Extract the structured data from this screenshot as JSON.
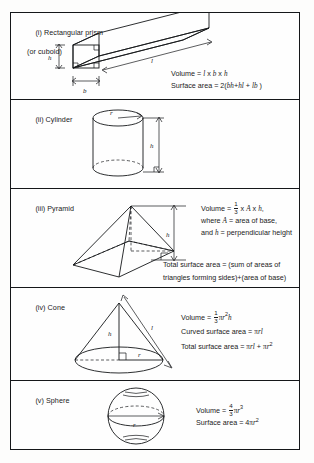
{
  "document": {
    "title": "Mensuration formulae for solids",
    "type": "formula-reference-table"
  },
  "sections": [
    {
      "id": "rectangular-prism",
      "numeral": "(i)",
      "label_line1": "(i) Rectangular prism",
      "label_line2": "(or cuboid)",
      "diagram": {
        "name": "rectangular-prism-diagram",
        "dimension_labels": [
          "h",
          "b",
          "l"
        ],
        "right_angle_marks": 3
      },
      "formulas": [
        {
          "lhs": "Volume",
          "rhs": "l x b x h"
        },
        {
          "lhs": "Surface area",
          "rhs": "2(bh + hl + lb)"
        }
      ]
    },
    {
      "id": "cylinder",
      "numeral": "(ii)",
      "label_line1": "(ii) Cylinder",
      "label_line2": "",
      "diagram": {
        "name": "cylinder-diagram",
        "dimension_labels": [
          "r",
          "h"
        ]
      },
      "formulas": [
        {
          "lhs": "Volume",
          "rhs": "πr²h"
        },
        {
          "lhs": "Total surface area",
          "rhs": "2πrh + 2πr²"
        }
      ]
    },
    {
      "id": "pyramid",
      "numeral": "(iii)",
      "label_line1": "(iii) Pyramid",
      "label_line2": "",
      "diagram": {
        "name": "pyramid-diagram",
        "dimension_labels": [
          "h"
        ]
      },
      "formula_lines": [
        "Volume = 1/3 x A x h,",
        "where A = area of base,",
        "and h = perpendicular height",
        "Total surface area = (sum of areas of",
        "triangles forming sides)+(area of base)"
      ]
    },
    {
      "id": "cone",
      "numeral": "(iv)",
      "label_line1": "(iv) Cone",
      "label_line2": "",
      "diagram": {
        "name": "cone-diagram",
        "dimension_labels": [
          "h",
          "l",
          "r"
        ]
      },
      "formulas": [
        {
          "lhs": "Volume",
          "rhs": "1/3 πr²h"
        },
        {
          "lhs": "Curved surface area",
          "rhs": "πrl"
        },
        {
          "lhs": "Total surface area",
          "rhs": "πrl + πr²"
        }
      ]
    },
    {
      "id": "sphere",
      "numeral": "(v)",
      "label_line1": "(v) Sphere",
      "label_line2": "",
      "diagram": {
        "name": "sphere-diagram",
        "dimension_labels": [
          "r"
        ]
      },
      "formulas": [
        {
          "lhs": "Volume",
          "rhs": "4/3 πr³"
        },
        {
          "lhs": "Surface area",
          "rhs": "4πr²"
        }
      ]
    }
  ],
  "text": {
    "s1_label1": "(i) Rectangular prism",
    "s1_label2": "(or cuboid)",
    "s1_vol_lhs": "Volume = ",
    "s1_vol_l": "l",
    "s1_vol_x1": " x ",
    "s1_vol_b": "b",
    "s1_vol_x2": " x ",
    "s1_vol_h": "h",
    "s1_sa_lhs": "Surface area = 2(",
    "s1_sa_bh": "bh",
    "s1_sa_p1": "+",
    "s1_sa_hl": "hl",
    "s1_sa_p2": " + ",
    "s1_sa_lb": "lb",
    "s1_sa_end": " )",
    "s1_dim_h": "h",
    "s1_dim_b": "b",
    "s1_dim_l": "l",
    "s2_label1": "(ii) Cylinder",
    "s2_vol": "Volume  =  ",
    "s2_vol_pi": "π",
    "s2_vol_r": "r",
    "s2_vol_sup": "2",
    "s2_vol_h": "h",
    "s2_tsa": "Total surface area = 2",
    "s2_tsa_pi": "π",
    "s2_tsa_r": "r",
    "s2_tsa_h": "h",
    "s2_tsa_plus": " + 2 ",
    "s2_tsa_pi2": "π",
    "s2_tsa_r2": "r",
    "s2_tsa_sup": "2",
    "s2_dim_r": "r",
    "s2_dim_h": "h",
    "s3_label1": "(iii) Pyramid",
    "s3_vol_pre": "Volume = ",
    "s3_frac_num": "1",
    "s3_frac_den": "3",
    "s3_vol_mid": " x ",
    "s3_vol_A": "A",
    "s3_vol_x": " x ",
    "s3_vol_h": "h",
    "s3_vol_end": ",",
    "s3_line2_pre": "where ",
    "s3_line2_A": "A",
    "s3_line2_post": " = area of base,",
    "s3_line3_pre": "and ",
    "s3_line3_h": "h",
    "s3_line3_post": " = perpendicular height",
    "s3_tsa_line1": "Total surface area = (sum of areas of",
    "s3_tsa_line2": "triangles forming sides)+(area of base)",
    "s3_dim_h": "h",
    "s4_label1": "(iv) Cone",
    "s4_vol_pre": "Volume = ",
    "s4_frac_num": "1",
    "s4_frac_den": "3",
    "s4_vol_pi": "π",
    "s4_vol_r": "r",
    "s4_vol_sup": "2",
    "s4_vol_h": "h",
    "s4_csa_pre": "Curved surface area = ",
    "s4_csa_pi": "π",
    "s4_csa_r": "r",
    "s4_csa_l": "l",
    "s4_tsa_pre": "Total surface area = ",
    "s4_tsa_pi": "π",
    "s4_tsa_r": "r",
    "s4_tsa_l": "l",
    "s4_tsa_plus": " + ",
    "s4_tsa_pi2": "π",
    "s4_tsa_r2": "r",
    "s4_tsa_sup": "2",
    "s4_dim_h": "h",
    "s4_dim_l": "l",
    "s4_dim_r": "r",
    "s5_label1": "(v) Sphere",
    "s5_vol_pre": "Volume = ",
    "s5_frac_num": "4",
    "s5_frac_den": "3",
    "s5_vol_pi": "π",
    "s5_vol_r": "r",
    "s5_vol_sup": "3",
    "s5_sa_pre": "Surface area = 4",
    "s5_sa_pi": "π",
    "s5_sa_r": "r",
    "s5_sa_sup": "2",
    "s5_dim_r": "r"
  },
  "colors": {
    "ink": "#15171a",
    "paper": "#fefefe"
  }
}
